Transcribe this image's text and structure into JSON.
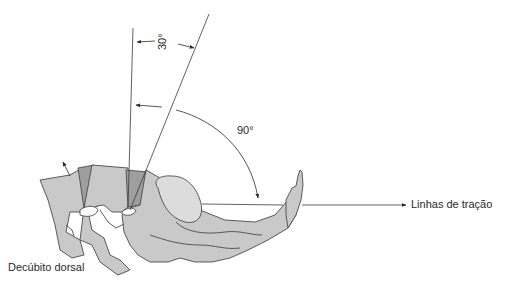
{
  "diagram": {
    "labels": {
      "angle_small": "30°",
      "angle_large": "90°",
      "traction_lines": "Linhas de tração",
      "position": "Decúbito dorsal"
    },
    "colors": {
      "bone_fill": "#c9c9c9",
      "bone_highlight": "#dcdcdc",
      "disc_fill": "#9e9e9e",
      "outline": "#4a4a4a",
      "line": "#3a3a3a",
      "text": "#2a2a2a"
    }
  }
}
